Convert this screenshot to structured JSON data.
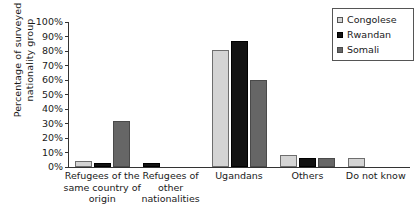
{
  "chart_data": {
    "type": "bar",
    "title": "",
    "xlabel": "",
    "ylabel": "Percentage of surveyed\nnationality group",
    "ylim": [
      0,
      100
    ],
    "grid": false,
    "legend_position": "top-right",
    "categories": [
      "Refugees of the\nsame country of\norigin",
      "Refugees of\nother\nnationalities",
      "Ugandans",
      "Others",
      "Do not know"
    ],
    "ytick_labels": [
      "100%",
      "90%",
      "80%",
      "70%",
      "60%",
      "50%",
      "40%",
      "30%",
      "20%",
      "10%",
      "0%"
    ],
    "ytick_values": [
      100,
      90,
      80,
      70,
      60,
      50,
      40,
      30,
      20,
      10,
      0
    ],
    "series": [
      {
        "name": "Congolese",
        "color": "#d4d4d4",
        "values": [
          4,
          0,
          81,
          8,
          6
        ]
      },
      {
        "name": "Rwandan",
        "color": "#121212",
        "values": [
          3,
          3,
          87,
          6,
          0
        ]
      },
      {
        "name": "Somali",
        "color": "#666666",
        "values": [
          32,
          0,
          60,
          6.5,
          0
        ]
      }
    ]
  },
  "legend": {
    "items": [
      {
        "label": "Congolese"
      },
      {
        "label": "Rwandan"
      },
      {
        "label": "Somali"
      }
    ]
  }
}
